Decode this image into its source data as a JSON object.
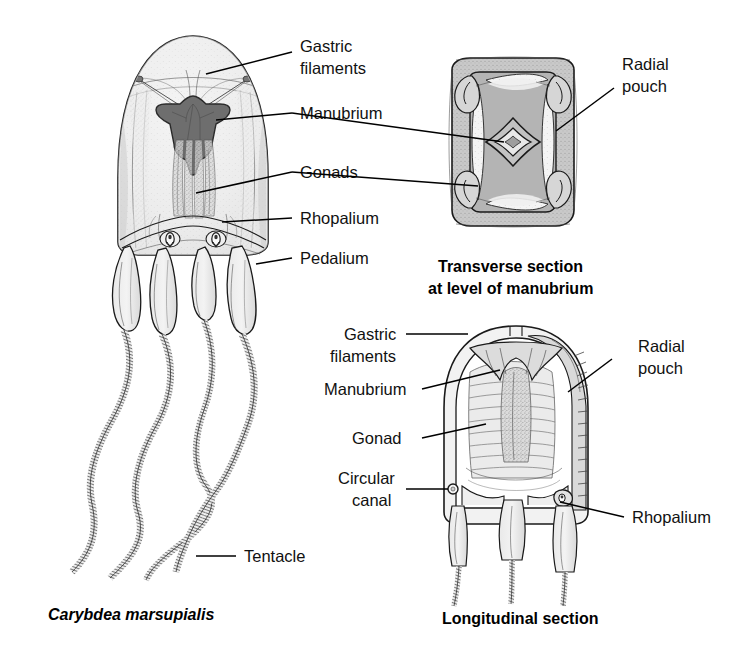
{
  "figure": {
    "title_species": "Carybdea marsupialis",
    "panels": [
      {
        "id": "whole-animal",
        "caption": "Carybdea marsupialis",
        "caption_style": "bold-italic"
      },
      {
        "id": "transverse-section",
        "caption_line1": "Transverse section",
        "caption_line2": "at level of manubrium",
        "caption_style": "bold"
      },
      {
        "id": "longitudinal-section",
        "caption": "Longitudinal section",
        "caption_style": "bold"
      }
    ]
  },
  "labels": {
    "whole_animal": [
      {
        "id": "gastric-filaments",
        "line1": "Gastric",
        "line2": "filaments"
      },
      {
        "id": "manubrium",
        "text": "Manubrium"
      },
      {
        "id": "gonads",
        "text": "Gonads"
      },
      {
        "id": "rhopalium",
        "text": "Rhopalium"
      },
      {
        "id": "pedalium",
        "text": "Pedalium"
      },
      {
        "id": "tentacle",
        "text": "Tentacle"
      }
    ],
    "transverse": [
      {
        "id": "radial-pouch",
        "line1": "Radial",
        "line2": "pouch"
      }
    ],
    "longitudinal": [
      {
        "id": "gastric-filaments",
        "line1": "Gastric",
        "line2": "filaments"
      },
      {
        "id": "manubrium",
        "text": "Manubrium"
      },
      {
        "id": "gonad",
        "text": "Gonad"
      },
      {
        "id": "circular-canal",
        "line1": "Circular",
        "line2": "canal"
      },
      {
        "id": "radial-pouch",
        "line1": "Radial",
        "line2": "pouch"
      },
      {
        "id": "rhopalium",
        "text": "Rhopalium"
      }
    ]
  },
  "colors": {
    "background": "#ffffff",
    "ink": "#1a1a1a",
    "bell_fill": "#e6e6e6",
    "bell_fill_light": "#f0f0f0",
    "manubrium_dark": "#6f6f6f",
    "section_gray": "#b3b3b3",
    "section_wall": "#cfcfcf",
    "pouch_light": "#f2f2f2",
    "text": "#111111"
  }
}
